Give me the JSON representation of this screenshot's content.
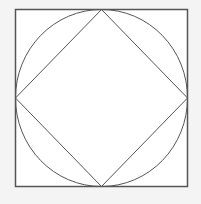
{
  "diagram": {
    "background_color": "#f4f4f4",
    "square": {
      "x": 15.5,
      "y": 9.5,
      "width": 172,
      "height": 177,
      "fill": "#ffffff",
      "stroke": "#555555",
      "stroke_width": 1.5
    },
    "circle": {
      "cx": 101.5,
      "cy": 98,
      "rx": 86,
      "ry": 88.5,
      "stroke": "#555555",
      "stroke_width": 1
    },
    "diamond": {
      "points": "101.5,9.5 187.5,98 101.5,186.5 15.5,98",
      "stroke": "#555555",
      "stroke_width": 1
    }
  }
}
